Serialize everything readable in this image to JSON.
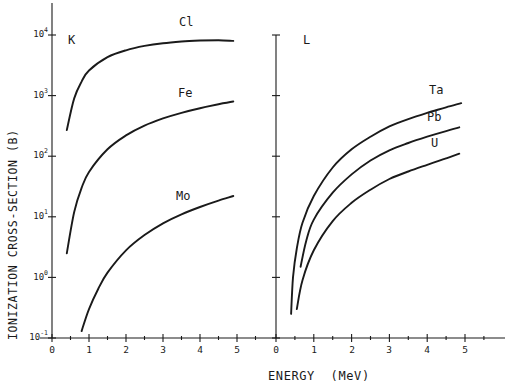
{
  "chart_data": {
    "type": "line",
    "title": "",
    "xlabel": "ENERGY (MeV)",
    "ylabel": "IONIZATION CROSS-SECTION (B)",
    "yscale": "log",
    "ylim": [
      0.1,
      30000
    ],
    "grid": false,
    "legend": "none (curves labeled inline)",
    "y_tick_labels": [
      "10^4",
      "10^3",
      "10^2",
      "10^1",
      "10^0",
      "10^-1"
    ],
    "panels": [
      {
        "label": "K",
        "x_tick_labels": [
          "0",
          "1",
          "2",
          "3",
          "4",
          "5"
        ],
        "xlim": [
          0,
          5.5
        ],
        "series": [
          {
            "name": "Cl",
            "x": [
              0.4,
              0.6,
              0.8,
              1.0,
              1.5,
              2.0,
              2.5,
              3.0,
              3.5,
              4.0,
              4.5,
              4.9
            ],
            "y": [
              270,
              900,
              1700,
              2600,
              4300,
              5600,
              6600,
              7300,
              7800,
              8100,
              8200,
              8000
            ]
          },
          {
            "name": "Fe",
            "x": [
              0.4,
              0.6,
              0.8,
              1.0,
              1.5,
              2.0,
              2.5,
              3.0,
              3.5,
              4.0,
              4.5,
              4.9
            ],
            "y": [
              2.5,
              12,
              30,
              55,
              130,
              220,
              320,
              420,
              520,
              620,
              720,
              800
            ]
          },
          {
            "name": "Mo",
            "x": [
              0.8,
              1.0,
              1.25,
              1.5,
              2.0,
              2.5,
              3.0,
              3.5,
              4.0,
              4.5,
              4.9
            ],
            "y": [
              0.13,
              0.3,
              0.65,
              1.2,
              2.8,
              5.0,
              7.8,
              11,
              14.5,
              18.5,
              22
            ]
          }
        ]
      },
      {
        "label": "L",
        "x_tick_labels": [
          "0",
          "1",
          "2",
          "3",
          "4",
          "5"
        ],
        "xlim": [
          0,
          5.6
        ],
        "series": [
          {
            "name": "Ta",
            "x": [
              0.4,
              0.45,
              0.55,
              0.7,
              1.0,
              1.5,
              2.0,
              2.5,
              3.0,
              3.5,
              4.0,
              4.5,
              4.9
            ],
            "y": [
              0.25,
              1.0,
              3.0,
              8.0,
              22,
              65,
              130,
              210,
              310,
              410,
              520,
              640,
              750
            ]
          },
          {
            "name": "Pb",
            "x": [
              0.65,
              0.8,
              1.0,
              1.5,
              2.0,
              2.5,
              3.0,
              3.5,
              4.0,
              4.5,
              4.85
            ],
            "y": [
              1.5,
              4.0,
              9.0,
              25,
              50,
              85,
              125,
              165,
              210,
              260,
              300
            ]
          },
          {
            "name": "U",
            "x": [
              0.55,
              0.7,
              1.0,
              1.5,
              2.0,
              2.5,
              3.0,
              3.5,
              4.0,
              4.5,
              4.85
            ],
            "y": [
              0.3,
              0.9,
              2.8,
              8.5,
              17,
              28,
              42,
              56,
              72,
              92,
              110
            ]
          }
        ]
      }
    ]
  },
  "labels": {
    "ylabel": "IONIZATION CROSS-SECTION (B)",
    "xlabel": "ENERGY  (MeV)",
    "panel_k": "K",
    "panel_l": "L",
    "cl": "Cl",
    "fe": "Fe",
    "mo": "Mo",
    "ta": "Ta",
    "pb": "Pb",
    "u": "U"
  },
  "y_ticks": [
    {
      "base": "10",
      "exp": "4"
    },
    {
      "base": "10",
      "exp": "3"
    },
    {
      "base": "10",
      "exp": "2"
    },
    {
      "base": "10",
      "exp": "1"
    },
    {
      "base": "10",
      "exp": "0"
    },
    {
      "base": "10",
      "exp": "-1"
    }
  ],
  "x_ticks_left": [
    "0",
    "1",
    "2",
    "3",
    "4",
    "5"
  ],
  "x_ticks_right": [
    "0",
    "1",
    "2",
    "3",
    "4",
    "5"
  ]
}
